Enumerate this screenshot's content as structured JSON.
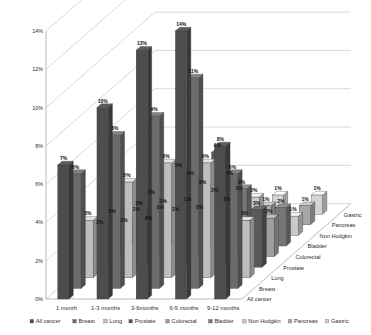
{
  "chart_data": {
    "type": "bar",
    "title": "",
    "subtitle": "",
    "xlabel": "",
    "ylabel": "",
    "zlabel": "",
    "projection": "3d-grouped-columns",
    "grid": true,
    "legend_position": "bottom",
    "ylim": [
      0,
      14
    ],
    "ytick_labels": [
      "0%",
      "2%",
      "4%",
      "6%",
      "8%",
      "10%",
      "12%",
      "14%"
    ],
    "ytick_values": [
      0,
      2,
      4,
      6,
      8,
      10,
      12,
      14
    ],
    "categories": [
      "1 month",
      "1-3 months",
      "3-6months",
      "6-9 months",
      "9-12 months"
    ],
    "depth_categories": [
      "All cancer",
      "Breast",
      "Lung",
      "Prostate",
      "Colorectal",
      "Bladder",
      "Non Hodgkin",
      "Pancreas",
      "Gastric"
    ],
    "value_suffix": "%",
    "series": [
      {
        "name": "All cancer",
        "values": [
          7,
          10,
          13,
          14,
          8
        ]
      },
      {
        "name": "Breast",
        "values": [
          6,
          8,
          9,
          11,
          6
        ]
      },
      {
        "name": "Lung",
        "values": [
          3,
          5,
          6,
          6,
          3
        ]
      },
      {
        "name": "Prostate",
        "values": [
          2,
          3,
          5,
          6,
          3
        ]
      },
      {
        "name": "Colorectal",
        "values": [
          2,
          3,
          4,
          4,
          2
        ]
      },
      {
        "name": "Bladder",
        "values": [
          1,
          2,
          3,
          3,
          2
        ]
      },
      {
        "name": "Non Hodgkin",
        "values": [
          1,
          1,
          2,
          2,
          1
        ]
      },
      {
        "name": "Pancreas",
        "values": [
          0,
          1,
          1,
          1,
          1
        ]
      },
      {
        "name": "Gastric",
        "values": [
          0,
          0,
          1,
          1,
          1
        ]
      }
    ],
    "data_labels": [
      [
        "7%",
        "10%",
        "13%",
        "14%",
        "8%"
      ],
      [
        "6%",
        "8%",
        "9%",
        "11%",
        "6%"
      ],
      [
        "3%",
        "5%",
        "6%",
        "6%",
        "3%"
      ],
      [
        "2%",
        "3%",
        "5%",
        "6%",
        "3%"
      ],
      [
        "2%",
        "3%",
        "4%",
        "4%",
        "2%"
      ],
      [
        "1%",
        "2%",
        "3%",
        "3%",
        "2%"
      ],
      [
        "1%",
        "1%",
        "2%",
        "2%",
        "1%"
      ],
      [
        "0%",
        "1%",
        "1%",
        "1%",
        "1%"
      ],
      [
        "0%",
        "0%",
        "1%",
        "1%",
        "1%"
      ]
    ],
    "series_colors": [
      "#4d4d4d",
      "#6b6b6b",
      "#bdbdbd",
      "#595959",
      "#9e9e9e",
      "#767676",
      "#c9c9c9",
      "#a8a8a8",
      "#d4d4d4"
    ]
  },
  "legend": {
    "items": [
      {
        "label": "All cancer",
        "color": "#4d4d4d"
      },
      {
        "label": "Breast",
        "color": "#6b6b6b"
      },
      {
        "label": "Lung",
        "color": "#bdbdbd"
      },
      {
        "label": "Prostate",
        "color": "#595959"
      },
      {
        "label": "Colorectal",
        "color": "#9e9e9e"
      },
      {
        "label": "Bladder",
        "color": "#767676"
      },
      {
        "label": "Non Hodgkin",
        "color": "#c9c9c9"
      },
      {
        "label": "Pancreas",
        "color": "#a8a8a8"
      },
      {
        "label": "Gastric",
        "color": "#d4d4d4"
      }
    ]
  }
}
